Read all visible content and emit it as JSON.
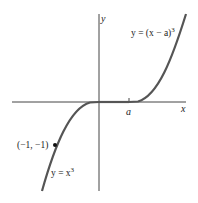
{
  "diagram": {
    "axes": {
      "x_label": "x",
      "y_label": "y",
      "tick_label_a": "a"
    },
    "curves": [
      {
        "name": "cubic",
        "label_prefix": "y = x",
        "label_exp": "3"
      },
      {
        "name": "shifted-cubic",
        "label_prefix": "y = (x − a)",
        "label_exp": "3"
      }
    ],
    "point": {
      "label": "(−1, −1)",
      "x": -1,
      "y": -1
    },
    "colors": {
      "axis": "#444444",
      "curve": "#555555",
      "text": "#222222",
      "point": "#111111"
    }
  }
}
